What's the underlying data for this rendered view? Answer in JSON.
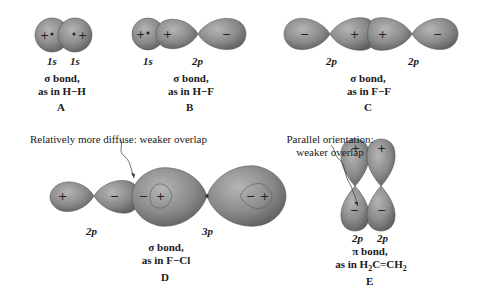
{
  "colors": {
    "orbital_fill": "#8a8a8a",
    "orbital_shade": "#6e6e6e",
    "orbital_highlight": "#bdbdbd",
    "outline": "#555555",
    "text": "#1a1a1a"
  },
  "panels": {
    "A": {
      "letter": "A",
      "orbitals": [
        "1s",
        "1s"
      ],
      "bond": "σ bond,",
      "example": "as in H−H",
      "signs": [
        "+",
        "+"
      ]
    },
    "B": {
      "letter": "B",
      "orbitals": [
        "1s",
        "2p"
      ],
      "bond": "σ bond,",
      "example": "as in H−F",
      "signs": [
        "+",
        "+",
        "−"
      ]
    },
    "C": {
      "letter": "C",
      "orbitals": [
        "2p",
        "2p"
      ],
      "bond": "σ bond,",
      "example": "as in F−F",
      "signs": [
        "−",
        "+",
        "+",
        "−"
      ]
    },
    "D": {
      "letter": "D",
      "orbitals": [
        "2p",
        "3p"
      ],
      "bond": "σ bond,",
      "example": "as in F−Cl",
      "signs": [
        "+",
        "−",
        "−",
        "+",
        "−",
        "+"
      ],
      "annotation": "Relatively more diffuse: weaker overlap"
    },
    "E": {
      "letter": "E",
      "orbitals": [
        "2p",
        "2p"
      ],
      "bond": "π bond,",
      "example_prefix": "as in H",
      "example_sub1": "2",
      "example_mid": "C=CH",
      "example_sub2": "2",
      "signs": [
        "+",
        "+",
        "−",
        "−"
      ],
      "annotation_line1": "Parallel orientation:",
      "annotation_line2": "weaker overlap"
    }
  }
}
